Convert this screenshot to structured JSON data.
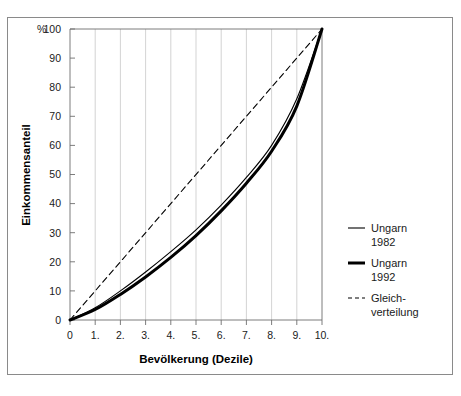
{
  "chart_data": {
    "type": "line",
    "title": "",
    "xlabel": "Bevölkerung (Dezile)",
    "ylabel": "Einkommensanteil",
    "yunit": "%",
    "xlim": [
      0,
      10
    ],
    "ylim": [
      0,
      100
    ],
    "grid": "vertical",
    "legend_position": "right",
    "x": [
      0,
      1,
      2,
      3,
      4,
      5,
      6,
      7,
      8,
      9,
      10
    ],
    "xticklabels": [
      "0",
      "1.",
      "2.",
      "3.",
      "4.",
      "5.",
      "6.",
      "7.",
      "8.",
      "9.",
      "10."
    ],
    "yticklabels": [
      "0",
      "10",
      "20",
      "30",
      "40",
      "50",
      "60",
      "70",
      "80",
      "90",
      "100"
    ],
    "yticks": [
      0,
      10,
      20,
      30,
      40,
      50,
      60,
      70,
      80,
      90,
      100
    ],
    "series": [
      {
        "name": "Ungarn 1982",
        "style": "solid-thin",
        "color": "#000000",
        "values": [
          0,
          4.2,
          10.0,
          16.5,
          23.5,
          31.0,
          39.5,
          49.0,
          60.0,
          76.0,
          100
        ]
      },
      {
        "name": "Ungarn 1992",
        "style": "solid-thick",
        "color": "#000000",
        "values": [
          0,
          3.6,
          8.8,
          14.8,
          21.5,
          29.0,
          37.5,
          47.0,
          58.0,
          73.5,
          100
        ]
      },
      {
        "name": "Gleichverteilung",
        "style": "dashed",
        "color": "#000000",
        "values": [
          0,
          10,
          20,
          30,
          40,
          50,
          60,
          70,
          80,
          90,
          100
        ]
      }
    ]
  },
  "legend": {
    "items": [
      {
        "line1": "Ungarn",
        "line2": "1982",
        "swatch": "thin-line-swatch"
      },
      {
        "line1": "Ungarn",
        "line2": "1992",
        "swatch": "thick-line-swatch"
      },
      {
        "line1": "Gleich-",
        "line2": "verteilung",
        "swatch": "dashed-line-swatch"
      }
    ]
  }
}
